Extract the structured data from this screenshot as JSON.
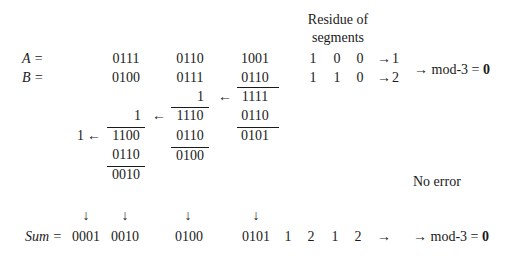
{
  "header": {
    "residue_line1": "Residue of",
    "residue_line2": "segments"
  },
  "rows": {
    "A": {
      "label": "A =",
      "segments": [
        "0111",
        "0110",
        "1001"
      ],
      "residue_digits": [
        "1",
        "0",
        "0"
      ],
      "arrow": "→",
      "residue": "1"
    },
    "B": {
      "label": "B =",
      "segments": [
        "0100",
        "0111",
        "0110"
      ],
      "residue_digits": [
        "1",
        "1",
        "0"
      ],
      "arrow": "→",
      "residue": "2"
    }
  },
  "mod_result_top": {
    "prefix": "→ mod-3 = ",
    "value": "0"
  },
  "steps": {
    "col3": {
      "sum": "1111",
      "correction": "0110",
      "result": "0101"
    },
    "col2": {
      "carry_in": "1",
      "sum": "1110",
      "correction": "0110",
      "result": "0100"
    },
    "col1": {
      "carry_in": "1",
      "sum": "1100",
      "correction": "0110",
      "result": "0010"
    },
    "carry_out": "1",
    "carry_arrow": "←"
  },
  "status": "No error",
  "down_arrow": "↓",
  "sum_row": {
    "label": "Sum =",
    "segments": [
      "0001",
      "0010",
      "0100",
      "0101"
    ],
    "residue_digits": [
      "1",
      "2",
      "1",
      "2"
    ],
    "arrow": "→",
    "mod_prefix": "→ mod-3 = ",
    "mod_value": "0"
  }
}
